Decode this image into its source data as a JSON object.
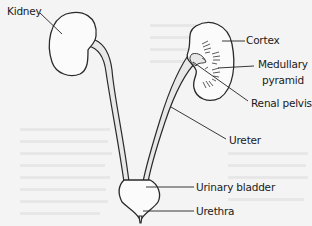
{
  "diagram": {
    "labels": {
      "kidney": "Kidney",
      "cortex": "Cortex",
      "medullary_line1": "Medullary",
      "medullary_line2": "pyramid",
      "renal_pelvis": "Renal pelvis",
      "ureter": "Ureter",
      "urinary_bladder": "Urinary bladder",
      "urethra": "Urethra"
    },
    "colors": {
      "background": "#f4f4f4",
      "outline": "#2a2a2a",
      "organ_fill": "#fbfbfb",
      "label_text": "#1a1a1a"
    }
  }
}
